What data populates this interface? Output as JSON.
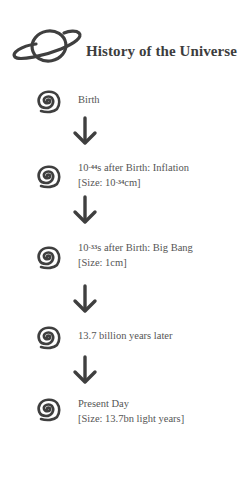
{
  "header": {
    "title": "History of the Universe",
    "icon": "planet-icon"
  },
  "steps": [
    {
      "icon": "spiral-icon",
      "line1_prefix": "Birth",
      "line1_exp": "",
      "line1_suffix": "",
      "line2_prefix": "",
      "line2_exp": "",
      "line2_suffix": ""
    },
    {
      "icon": "spiral-icon",
      "line1_prefix": "10",
      "line1_exp": "-44",
      "line1_suffix": "s after Birth: Inflation",
      "line2_prefix": "[Size: 10",
      "line2_exp": "-34",
      "line2_suffix": "cm]"
    },
    {
      "icon": "spiral-icon",
      "line1_prefix": "10",
      "line1_exp": "-33",
      "line1_suffix": "s after Birth: Big Bang",
      "line2_prefix": "[Size: 1cm]",
      "line2_exp": "",
      "line2_suffix": ""
    },
    {
      "icon": "spiral-icon",
      "line1_prefix": "13.7 billion years later",
      "line1_exp": "",
      "line1_suffix": "",
      "line2_prefix": "",
      "line2_exp": "",
      "line2_suffix": ""
    },
    {
      "icon": "spiral-icon",
      "line1_prefix": "Present Day",
      "line1_exp": "",
      "line1_suffix": "",
      "line2_prefix": "[Size: 13.7bn light years]",
      "line2_exp": "",
      "line2_suffix": ""
    }
  ],
  "arrows": [
    "down-arrow-icon",
    "down-arrow-icon",
    "down-arrow-icon",
    "down-arrow-icon"
  ],
  "colors": {
    "ink": "#3d3d3d",
    "text": "#555555",
    "background": "#ffffff"
  }
}
